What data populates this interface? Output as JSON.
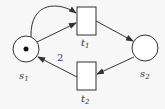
{
  "diagram": {
    "type": "petri-net",
    "places": [
      {
        "id": "s1",
        "label": "s",
        "sub": "1",
        "tokens": 1
      },
      {
        "id": "s2",
        "label": "s",
        "sub": "2",
        "tokens": 0
      }
    ],
    "transitions": [
      {
        "id": "t1",
        "label": "t",
        "sub": "1"
      },
      {
        "id": "t2",
        "label": "t",
        "sub": "2"
      }
    ],
    "arcs": [
      {
        "from": "s1",
        "to": "t1",
        "weight": 1,
        "style": "straight"
      },
      {
        "from": "s1",
        "to": "t1",
        "weight": 1,
        "style": "curved"
      },
      {
        "from": "t1",
        "to": "s2",
        "weight": 1
      },
      {
        "from": "s2",
        "to": "t2",
        "weight": 1
      },
      {
        "from": "t2",
        "to": "s1",
        "weight": 2,
        "weight_label": "2"
      }
    ],
    "colors": {
      "stroke": "#333333",
      "background": "#f7f7f7"
    }
  }
}
